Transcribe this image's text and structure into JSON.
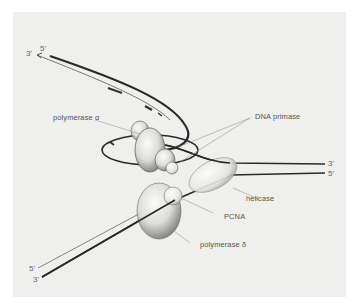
{
  "figure": {
    "background": "#efefed",
    "ink": "#2a2a2a",
    "protein_fill": "#e6e6e4"
  },
  "strand_ends": {
    "top_left_3": "3'",
    "top_left_5": "5'",
    "right_3": "3'",
    "right_5": "5'",
    "bottom_left_5": "5'",
    "bottom_left_3": "3'"
  },
  "labels": {
    "polymerase_alpha": "polymerase α",
    "dna_primase": "DNA primase",
    "helicase": "helicase",
    "pcna": "PCNA",
    "polymerase_delta": "polymerase δ"
  },
  "components": [
    {
      "name": "polymerase α",
      "icon": "protein-blob"
    },
    {
      "name": "DNA primase",
      "icon": "protein-blob"
    },
    {
      "name": "helicase",
      "icon": "protein-ellipse"
    },
    {
      "name": "PCNA",
      "icon": "sliding-clamp"
    },
    {
      "name": "polymerase δ",
      "icon": "protein-blob"
    }
  ]
}
